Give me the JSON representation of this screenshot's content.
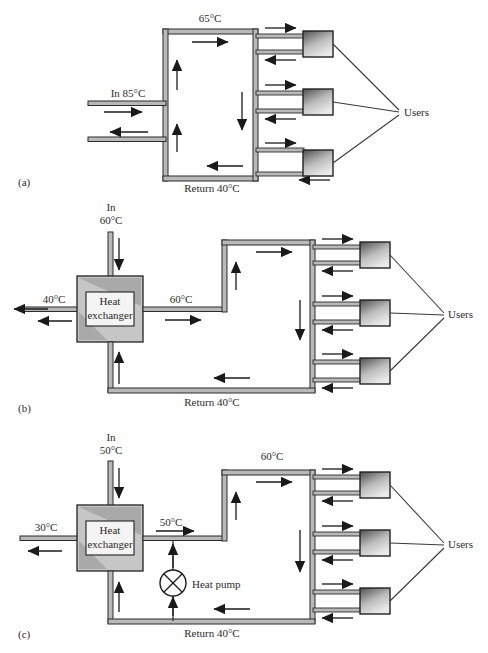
{
  "figure": {
    "type": "schematic-diagram",
    "panels": [
      {
        "id": "a",
        "id_label": "(a)",
        "description": "Direct connection district heating network",
        "labels": {
          "supply_temp": "65°C",
          "inlet": "In 85°C",
          "return": "Return 40°C",
          "users": "Users"
        },
        "components": [
          "supply-pipe",
          "return-pipe",
          "distribution-loop",
          "user-substation",
          "user-substation",
          "user-substation"
        ],
        "flow_arrows": 8
      },
      {
        "id": "b",
        "id_label": "(b)",
        "description": "Indirect connection via heat exchanger",
        "labels": {
          "inlet_title": "In",
          "inlet_temp": "60°C",
          "outlet_temp": "40°C",
          "exchanger_line1": "Heat",
          "exchanger_line2": "exchanger",
          "supply_temp": "60°C",
          "return": "Return 40°C",
          "users": "Users"
        },
        "components": [
          "heat-exchanger",
          "supply-pipe",
          "return-pipe",
          "distribution-loop",
          "user-substation",
          "user-substation",
          "user-substation"
        ],
        "flow_arrows": 9
      },
      {
        "id": "c",
        "id_label": "(c)",
        "description": "Indirect connection with heat exchanger and heat pump boost",
        "labels": {
          "inlet_title": "In",
          "inlet_temp": "50°C",
          "outlet_temp": "30°C",
          "exchanger_line1": "Heat",
          "exchanger_line2": "exchanger",
          "supply_temp_low": "50°C",
          "supply_temp_high": "60°C",
          "heat_pump": "Heat pump",
          "return": "Return 40°C",
          "users": "Users"
        },
        "components": [
          "heat-exchanger",
          "heat-pump",
          "supply-pipe",
          "return-pipe",
          "distribution-loop",
          "user-substation",
          "user-substation",
          "user-substation"
        ],
        "flow_arrows": 10
      }
    ],
    "colors": {
      "line": "#2b2b2b",
      "pipe_fill": "#b9b9b9",
      "exchanger_fill": "#c9c9c9",
      "exchanger_inner": "#f2f2f2",
      "box_dark": "#4a4a4a",
      "box_light": "#e8e8e8",
      "background": "#ffffff"
    }
  }
}
